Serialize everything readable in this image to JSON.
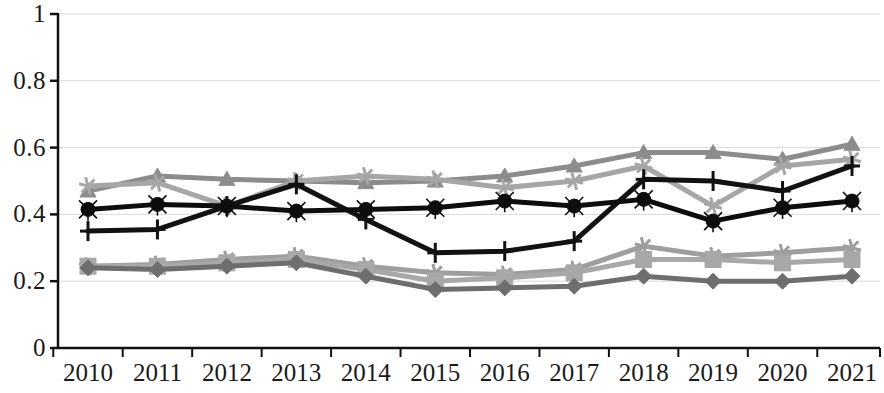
{
  "chart_data": {
    "type": "line",
    "title": "",
    "subtitle": "",
    "xlabel": "",
    "ylabel": "",
    "grid": true,
    "legend_position": "none",
    "xlim": [
      2010,
      2021
    ],
    "ylim": [
      0,
      1
    ],
    "ytick_labels": [
      "1",
      "0.8",
      "0.6",
      "0.4",
      "0.2",
      "0"
    ],
    "ytick_values": [
      1,
      0.8,
      0.6,
      0.4,
      0.2,
      0
    ],
    "categories": [
      2010,
      2011,
      2012,
      2013,
      2014,
      2015,
      2016,
      2017,
      2018,
      2019,
      2020,
      2021
    ],
    "xtick_labels": [
      "2010",
      "2011",
      "2012",
      "2013",
      "2014",
      "2015",
      "2016",
      "2017",
      "2018",
      "2019",
      "2020",
      "2021"
    ],
    "series": [
      {
        "name": "series-triangle",
        "marker": "triangle",
        "color": "#8c8c8c",
        "values": [
          0.47,
          0.515,
          0.505,
          0.5,
          0.495,
          0.5,
          0.515,
          0.545,
          0.585,
          0.585,
          0.565,
          0.61
        ]
      },
      {
        "name": "series-asterisk-upper",
        "marker": "asterisk",
        "color": "#a6a6a6",
        "values": [
          0.485,
          0.495,
          0.425,
          0.5,
          0.515,
          0.505,
          0.48,
          0.5,
          0.545,
          0.425,
          0.545,
          0.565
        ]
      },
      {
        "name": "series-plus",
        "marker": "plus",
        "color": "#121212",
        "values": [
          0.35,
          0.355,
          0.425,
          0.49,
          0.385,
          0.285,
          0.29,
          0.32,
          0.505,
          0.5,
          0.47,
          0.545
        ]
      },
      {
        "name": "series-circle",
        "marker": "circle",
        "color": "#0d0d0d",
        "values": [
          0.415,
          0.43,
          0.425,
          0.41,
          0.415,
          0.42,
          0.44,
          0.425,
          0.445,
          0.38,
          0.42,
          0.44
        ]
      },
      {
        "name": "series-asterisk-lower",
        "marker": "asterisk",
        "color": "#9e9e9e",
        "values": [
          0.245,
          0.25,
          0.265,
          0.275,
          0.245,
          0.225,
          0.22,
          0.235,
          0.305,
          0.275,
          0.285,
          0.3
        ]
      },
      {
        "name": "series-square",
        "marker": "square",
        "color": "#a8a8a8",
        "values": [
          0.245,
          0.245,
          0.255,
          0.265,
          0.235,
          0.2,
          0.21,
          0.225,
          0.265,
          0.265,
          0.255,
          0.265
        ]
      },
      {
        "name": "series-diamond",
        "marker": "diamond",
        "color": "#6e6e6e",
        "values": [
          0.24,
          0.235,
          0.245,
          0.255,
          0.215,
          0.175,
          0.18,
          0.185,
          0.215,
          0.2,
          0.2,
          0.215
        ]
      }
    ]
  },
  "axis": {
    "line_color": "#111111",
    "grid_color": "#d9d9d9"
  }
}
